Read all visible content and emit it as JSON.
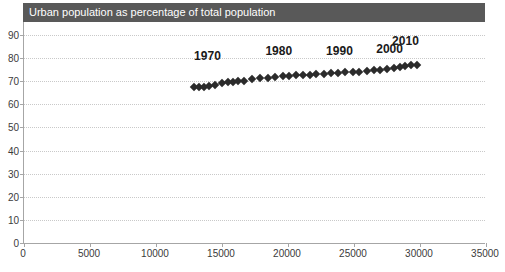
{
  "chart_data": {
    "type": "scatter",
    "title": "Urban population as percentage of total population",
    "xlabel": "",
    "ylabel": "",
    "xlim": [
      0,
      35000
    ],
    "ylim": [
      0,
      90
    ],
    "grid": true,
    "legend": "none",
    "x_ticks": [
      0,
      5000,
      10000,
      15000,
      20000,
      25000,
      30000,
      35000
    ],
    "x_tick_labels": [
      "0",
      "5000",
      "10000",
      "15000",
      "20000",
      "25000",
      "30000",
      "35000"
    ],
    "y_ticks": [
      0,
      10,
      20,
      30,
      40,
      50,
      60,
      70,
      80,
      90
    ],
    "y_tick_labels": [
      "0",
      "10",
      "20",
      "30",
      "40",
      "50",
      "60",
      "70",
      "80",
      "90"
    ],
    "series_name": "Urban population vs GDP per capita",
    "marker": "diamond",
    "marker_color": "#2b2b2b",
    "points": [
      {
        "x": 12900,
        "y": 67.3
      },
      {
        "x": 13250,
        "y": 67.5
      },
      {
        "x": 13600,
        "y": 67.7
      },
      {
        "x": 14050,
        "y": 68.0
      },
      {
        "x": 14500,
        "y": 68.3
      },
      {
        "x": 15000,
        "y": 69.3
      },
      {
        "x": 15450,
        "y": 69.6
      },
      {
        "x": 15800,
        "y": 69.8
      },
      {
        "x": 16200,
        "y": 70.0
      },
      {
        "x": 16700,
        "y": 70.3
      },
      {
        "x": 17300,
        "y": 70.8
      },
      {
        "x": 17900,
        "y": 71.2
      },
      {
        "x": 18500,
        "y": 71.6
      },
      {
        "x": 19050,
        "y": 72.0
      },
      {
        "x": 19600,
        "y": 72.3
      },
      {
        "x": 20100,
        "y": 72.4
      },
      {
        "x": 20600,
        "y": 72.5
      },
      {
        "x": 21100,
        "y": 72.6
      },
      {
        "x": 21650,
        "y": 72.8
      },
      {
        "x": 22150,
        "y": 73.0
      },
      {
        "x": 22700,
        "y": 73.2
      },
      {
        "x": 23250,
        "y": 73.4
      },
      {
        "x": 23800,
        "y": 73.6
      },
      {
        "x": 24350,
        "y": 73.8
      },
      {
        "x": 24900,
        "y": 74.0
      },
      {
        "x": 25400,
        "y": 74.2
      },
      {
        "x": 26000,
        "y": 74.5
      },
      {
        "x": 26500,
        "y": 74.8
      },
      {
        "x": 27000,
        "y": 75.0
      },
      {
        "x": 27500,
        "y": 75.3
      },
      {
        "x": 28000,
        "y": 75.7
      },
      {
        "x": 28450,
        "y": 76.2
      },
      {
        "x": 28900,
        "y": 76.6
      },
      {
        "x": 29350,
        "y": 76.9
      },
      {
        "x": 29750,
        "y": 77.0
      }
    ],
    "annotations": [
      {
        "text": "1970",
        "x": 13900,
        "y": 80.5
      },
      {
        "text": "1980",
        "x": 19300,
        "y": 82.5
      },
      {
        "text": "1990",
        "x": 23900,
        "y": 82.5
      },
      {
        "text": "2000",
        "x": 27700,
        "y": 83.5
      },
      {
        "text": "2010",
        "x": 28900,
        "y": 87.0
      }
    ]
  },
  "clipped_header_text": ""
}
